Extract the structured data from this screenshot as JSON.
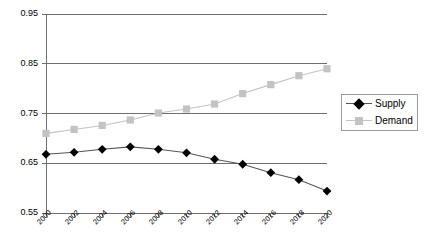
{
  "chart_data": {
    "type": "line",
    "title": "",
    "xlabel": "",
    "ylabel": "",
    "ylim": [
      0.55,
      0.95
    ],
    "ytick_values": [
      0.95,
      0.85,
      0.75,
      0.65,
      0.55
    ],
    "ytick_labels": [
      "0.95",
      "0.85",
      "0.75",
      "0.65",
      "0.55"
    ],
    "xlim": [
      2000,
      2020
    ],
    "grid": "horizontal",
    "legend_position": "right-outside",
    "categories": [
      2000,
      2002,
      2004,
      2006,
      2008,
      2010,
      2012,
      2014,
      2016,
      2018,
      2020
    ],
    "xtick_labels": [
      "2000",
      "2002",
      "2004",
      "2006",
      "2008",
      "2010",
      "2012",
      "2014",
      "2016",
      "2018",
      "2020"
    ],
    "series": [
      {
        "name": "Supply",
        "marker": "diamond",
        "color": "#000000",
        "line_color": "#555555",
        "values": [
          0.668,
          0.672,
          0.678,
          0.683,
          0.678,
          0.671,
          0.658,
          0.648,
          0.631,
          0.617,
          0.594
        ]
      },
      {
        "name": "Demand",
        "marker": "square",
        "color": "#c3c3c3",
        "line_color": "#c3c3c3",
        "values": [
          0.71,
          0.718,
          0.726,
          0.737,
          0.751,
          0.759,
          0.769,
          0.79,
          0.808,
          0.826,
          0.84
        ]
      }
    ]
  },
  "legend": {
    "items": [
      {
        "label": "Supply",
        "marker": "diamond-icon",
        "color": "#000000"
      },
      {
        "label": "Demand",
        "marker": "square-icon",
        "color": "#c3c3c3"
      }
    ]
  }
}
